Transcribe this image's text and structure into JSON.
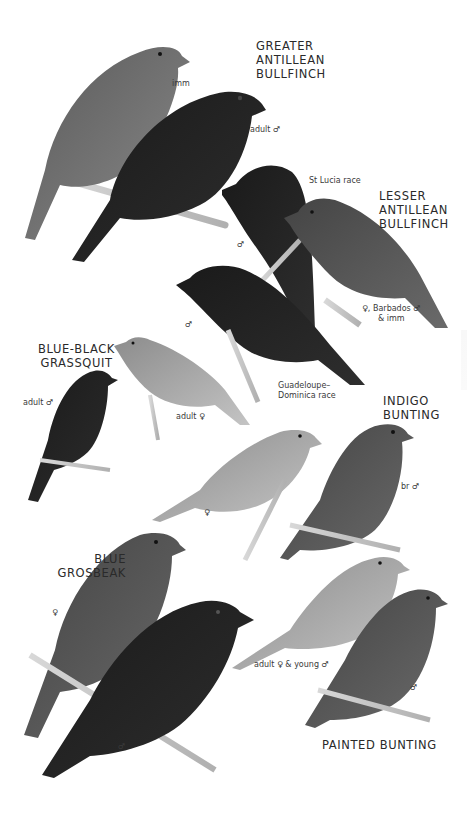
{
  "plate": {
    "background": "#ffffff",
    "ink_color": "#2a2a2a",
    "species": [
      {
        "id": "greater-antillean-bullfinch",
        "name": "GREATER\nANTILLEAN\nBULLFINCH",
        "captions": [
          "imm",
          "adult ♂"
        ]
      },
      {
        "id": "lesser-antillean-bullfinch",
        "name": "LESSER\nANTILLEAN\nBULLFINCH",
        "captions": [
          "St Lucia race",
          "♂",
          "♀, Barbados ♂\n& imm",
          "♂",
          "Guadeloupe–\nDominica race"
        ]
      },
      {
        "id": "blue-black-grassquit",
        "name": "BLUE-BLACK\nGRASSQUIT",
        "captions": [
          "adult ♂",
          "adult ♀"
        ]
      },
      {
        "id": "indigo-bunting",
        "name": "INDIGO\nBUNTING",
        "captions": [
          "♀",
          "br ♂"
        ]
      },
      {
        "id": "blue-grosbeak",
        "name": "BLUE\nGROSBEAK",
        "captions": [
          "♀",
          "♂"
        ]
      },
      {
        "id": "painted-bunting",
        "name": "PAINTED BUNTING",
        "captions": [
          "adult ♀ & young ♂",
          "♂"
        ]
      }
    ]
  }
}
